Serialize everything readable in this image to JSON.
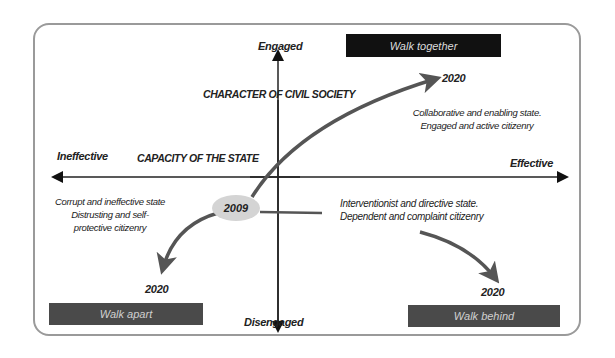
{
  "axes": {
    "vertical": {
      "title": "CHARACTER OF CIVIL SOCIETY",
      "top_pole": "Engaged",
      "bottom_pole": "Disengaged"
    },
    "horizontal": {
      "title": "CAPACITY OF THE STATE",
      "left_pole": "Ineffective",
      "right_pole": "Effective"
    }
  },
  "origin": {
    "year": "2009"
  },
  "scenarios": {
    "walk_together": {
      "label": "Walk together",
      "year": "2020",
      "desc_line1": "Collaborative and enabling state.",
      "desc_line2": "Engaged and active citizenry"
    },
    "walk_apart": {
      "label": "Walk apart",
      "year": "2020",
      "desc_line1": "Corrupt and ineffective state",
      "desc_line2": "Distrusting and self-",
      "desc_line3": "protective citizenry"
    },
    "walk_behind": {
      "label": "Walk behind",
      "year": "2020",
      "desc_line1": "Interventionist and directive state.",
      "desc_line2": "Dependent and complaint citizenry"
    }
  },
  "colors": {
    "frame": "#9a9a9a",
    "arrow": "#4a4a4a",
    "box_dark": "#111111",
    "box_grey": "#4a4a4a",
    "ellipse": "#d4d4d4"
  }
}
